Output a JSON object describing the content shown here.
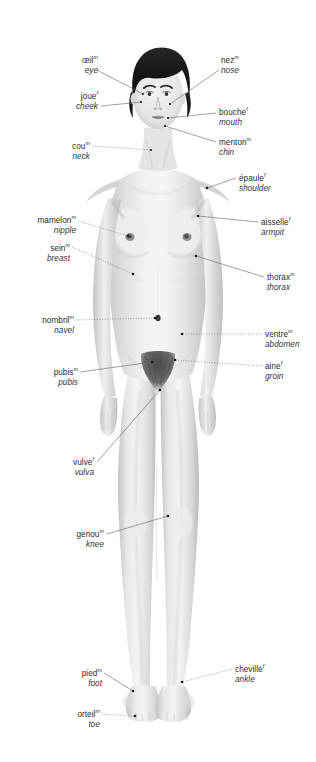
{
  "diagram": {
    "background_color": "#ffffff",
    "label_color": "#2b2b2b",
    "leader_color": "#5a5a5a",
    "marker_color": "#1c1c1c",
    "gender_marker_masculine": "m",
    "gender_marker_feminine": "f"
  },
  "labels": {
    "eye": {
      "fr": "œil",
      "gender": "m",
      "en": "eye"
    },
    "cheek": {
      "fr": "joue",
      "gender": "f",
      "en": "cheek"
    },
    "neck": {
      "fr": "cou",
      "gender": "m",
      "en": "neck"
    },
    "nipple": {
      "fr": "mamelon",
      "gender": "m",
      "en": "nipple"
    },
    "breast": {
      "fr": "sein",
      "gender": "m",
      "en": "breast"
    },
    "navel": {
      "fr": "nombril",
      "gender": "m",
      "en": "navel"
    },
    "pubis": {
      "fr": "pubis",
      "gender": "m",
      "en": "pubis"
    },
    "vulva": {
      "fr": "vulve",
      "gender": "f",
      "en": "vulva"
    },
    "knee": {
      "fr": "genou",
      "gender": "m",
      "en": "knee"
    },
    "foot": {
      "fr": "pied",
      "gender": "m",
      "en": "foot"
    },
    "toe": {
      "fr": "orteil",
      "gender": "m",
      "en": "toe"
    },
    "nose": {
      "fr": "nez",
      "gender": "m",
      "en": "nose"
    },
    "mouth": {
      "fr": "bouche",
      "gender": "f",
      "en": "mouth"
    },
    "chin": {
      "fr": "menton",
      "gender": "m",
      "en": "chin"
    },
    "shoulder": {
      "fr": "épaule",
      "gender": "f",
      "en": "shoulder"
    },
    "armpit": {
      "fr": "aisselle",
      "gender": "f",
      "en": "armpit"
    },
    "thorax": {
      "fr": "thorax",
      "gender": "m",
      "en": "thorax"
    },
    "abdomen": {
      "fr": "ventre",
      "gender": "m",
      "en": "abdomen"
    },
    "groin": {
      "fr": "aine",
      "gender": "f",
      "en": "groin"
    },
    "ankle": {
      "fr": "cheville",
      "gender": "f",
      "en": "ankle"
    }
  }
}
